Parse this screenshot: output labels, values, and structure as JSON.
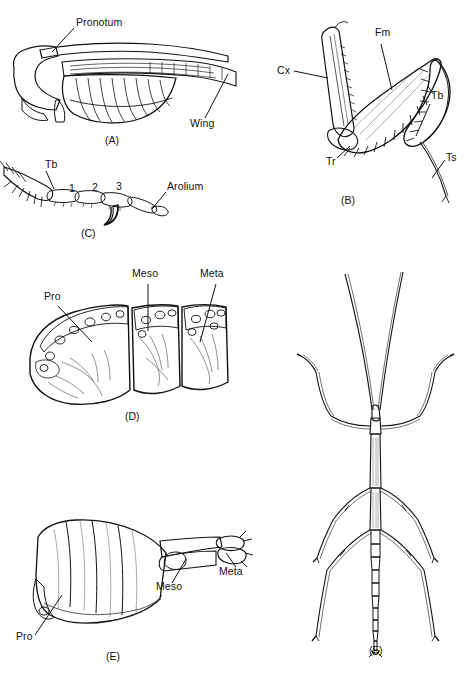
{
  "figure": {
    "type": "scientific-illustration-plate",
    "background_color": "#ffffff",
    "ink_color": "#111111",
    "panel_count": 6
  },
  "panels": [
    {
      "id": "A",
      "caption": "(A)",
      "description": "Lateral view of thorax and wing",
      "labels": [
        {
          "text": "Pronotum",
          "name": "label-pronotum"
        },
        {
          "text": "Wing",
          "name": "label-wing"
        }
      ]
    },
    {
      "id": "B",
      "caption": "(B)",
      "description": "Raptorial foreleg with spines",
      "labels": [
        {
          "text": "Cx",
          "name": "label-cx"
        },
        {
          "text": "Fm",
          "name": "label-fm"
        },
        {
          "text": "Tb",
          "name": "label-tb"
        },
        {
          "text": "Tr",
          "name": "label-tr"
        },
        {
          "text": "Ts",
          "name": "label-ts"
        }
      ]
    },
    {
      "id": "C",
      "caption": "(C)",
      "description": "Tarsus with three segments, claw and arolium",
      "labels": [
        {
          "text": "Tb",
          "name": "label-tb"
        },
        {
          "text": "Arolium",
          "name": "label-arolium"
        }
      ],
      "segment_numbers": [
        "1",
        "2",
        "3"
      ]
    },
    {
      "id": "D",
      "caption": "(D)",
      "description": "Three thoracic nota in dorsal-lateral view",
      "labels": [
        {
          "text": "Pro",
          "name": "label-pro"
        },
        {
          "text": "Meso",
          "name": "label-meso"
        },
        {
          "text": "Meta",
          "name": "label-meta"
        }
      ]
    },
    {
      "id": "E",
      "caption": "(E)",
      "description": "Thoracic sterna in lateral view",
      "labels": [
        {
          "text": "Pro",
          "name": "label-pro"
        },
        {
          "text": "Meso",
          "name": "label-meso"
        },
        {
          "text": "Meta",
          "name": "label-meta"
        }
      ]
    },
    {
      "id": "F",
      "caption": "(F)",
      "description": "Whole stick insect, dorsal view",
      "labels": []
    }
  ]
}
